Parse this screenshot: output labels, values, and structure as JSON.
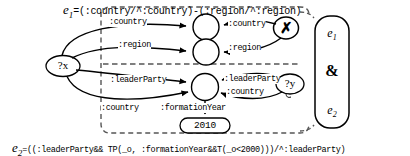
{
  "diagram": {
    "title_formula": {
      "var": "e",
      "sub": "1",
      "eq": "=(:country/^:country)-(:region/^:region)"
    },
    "bottom_formula": {
      "var": "e",
      "sub": "2",
      "eq": "=((:leaderParty&& TP(_o, :formationYear&&T(_o<2000)))/^:leaderParty)"
    },
    "nodes": {
      "subject": "?x",
      "object_y": "?y",
      "literal_2010": "2010",
      "negation_mark": "✗"
    },
    "edges": {
      "country_out": ":country",
      "country_in": ":country",
      "region_out": ":region",
      "region_in": ":region",
      "leader_party_out": ":leaderParty",
      "leader_party_in": ":leaderParty",
      "country_in_lower": ":country",
      "country_out_lower": ":country",
      "formation_year": ":formationYear"
    },
    "bracket": {
      "top_var": "e",
      "top_sub": "1",
      "operator": "&",
      "bottom_var": "e",
      "bottom_sub": "2"
    },
    "colors": {
      "stroke": "#000000",
      "background": "#ffffff",
      "dashed": "#555555"
    }
  }
}
